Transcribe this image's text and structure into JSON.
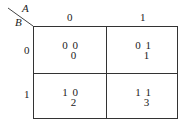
{
  "kmap": {
    "var_col": "A",
    "var_row": "B",
    "col_headers": [
      "0",
      "1"
    ],
    "row_headers": [
      "0",
      "1"
    ],
    "cells": [
      {
        "code": "0 0",
        "index": "0"
      },
      {
        "code": "0 1",
        "index": "1"
      },
      {
        "code": "1 0",
        "index": "2"
      },
      {
        "code": "1 1",
        "index": "3"
      }
    ]
  }
}
